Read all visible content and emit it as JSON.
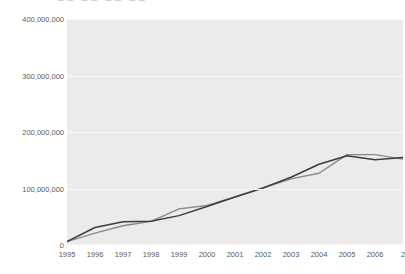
{
  "title": {
    "text": "■■ ■■ ■■ ■■",
    "note": "clipped-at-top"
  },
  "chart_data": {
    "type": "line",
    "title": "",
    "xlabel": "",
    "ylabel": "",
    "grid": true,
    "legend": "none",
    "x": [
      1995,
      1996,
      1997,
      1998,
      1999,
      2000,
      2001,
      2002,
      2003,
      2004,
      2005,
      2006,
      2007
    ],
    "xtick_labels": [
      "1995",
      "1996",
      "1997",
      "1998",
      "1999",
      "2000",
      "2001",
      "2002",
      "2003",
      "2004",
      "2005",
      "2006",
      "2"
    ],
    "ytick_labels": [
      "0",
      "100,000,000",
      "200,000,000",
      "300,000,000",
      "400,000,000"
    ],
    "ytick_values": [
      0,
      100000000,
      200000000,
      300000000,
      400000000
    ],
    "ylim": [
      0,
      400000000
    ],
    "xlim": [
      1995,
      2007
    ],
    "series": [
      {
        "name": "series-1",
        "color": "#3d3d3d",
        "values": [
          6000000,
          31000000,
          41000000,
          42000000,
          52000000,
          68000000,
          85000000,
          101000000,
          120000000,
          143000000,
          158000000,
          151000000,
          155000000
        ]
      },
      {
        "name": "series-2",
        "color": "#8a8a8a",
        "values": [
          6000000,
          21000000,
          34000000,
          42000000,
          64000000,
          70000000,
          85000000,
          101000000,
          117000000,
          127000000,
          160000000,
          160000000,
          152000000
        ]
      }
    ]
  }
}
